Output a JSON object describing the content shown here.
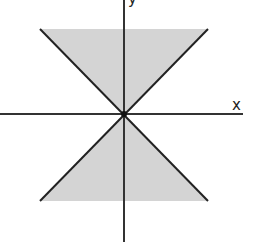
{
  "diagram": {
    "x_axis_label": "x",
    "y_axis_label": "y",
    "colors": {
      "background": "#ffffff",
      "shading": "#d4d4d4",
      "lines": "#222222",
      "axes": "#333333"
    },
    "regions": [
      {
        "name": "upper-triangle",
        "description": "shaded region above origin between y=|x|"
      },
      {
        "name": "lower-triangle",
        "description": "shaded region below origin between y=-|x|"
      }
    ],
    "lines": [
      {
        "name": "y = x"
      },
      {
        "name": "y = -x"
      }
    ]
  }
}
